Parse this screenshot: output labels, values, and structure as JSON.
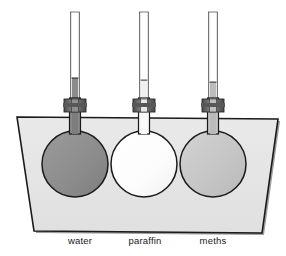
{
  "diagram": {
    "background_color": "#ffffff",
    "tank": {
      "name": "water bath tank",
      "fill_color": "#e6e6e6",
      "stroke_color": "#1a1a1a",
      "shadow_color": "#9a9a9a"
    },
    "flasks": [
      {
        "id": "water",
        "label": "water",
        "bulb_fill": "#8e8e8e",
        "bulb_stroke": "#1a1a1a",
        "tube_liquid_fill": "#8e8e8e",
        "tube_liquid_top_y": 78,
        "stopper_fill": "#6e6e6e",
        "center_x": 75,
        "center_y": 164,
        "radius": 33,
        "label_x": 80,
        "label_y": 244
      },
      {
        "id": "paraffin",
        "label": "paraffin",
        "bulb_fill": "#fbfbfb",
        "bulb_stroke": "#1a1a1a",
        "tube_liquid_fill": "#f2f2f2",
        "tube_liquid_top_y": 80,
        "stopper_fill": "#6e6e6e",
        "center_x": 144,
        "center_y": 164,
        "radius": 33,
        "label_x": 145,
        "label_y": 244
      },
      {
        "id": "meths",
        "label": "meths",
        "bulb_fill": "#c6c6c6",
        "bulb_stroke": "#1a1a1a",
        "tube_liquid_fill": "#bdbdbd",
        "tube_liquid_top_y": 82,
        "stopper_fill": "#6e6e6e",
        "center_x": 213,
        "center_y": 164,
        "radius": 33,
        "label_x": 213,
        "label_y": 244
      }
    ],
    "tube": {
      "name": "capillary tube",
      "top_y": 12,
      "outer_fill": "#fdfdfd",
      "outer_stroke": "#555555",
      "width": 9
    }
  }
}
